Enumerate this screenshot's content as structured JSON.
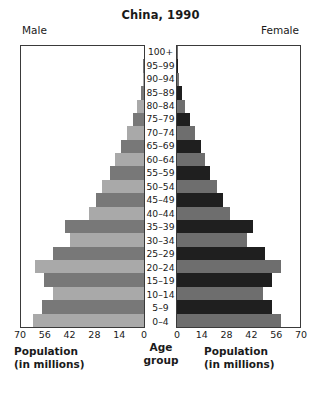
{
  "chart_data": {
    "type": "bar",
    "title": "China, 1990",
    "subtype": "population-pyramid",
    "xlabel": "Population (in millions)",
    "ylabel": "Age group",
    "left_header": "Male",
    "right_header": "Female",
    "xlim": [
      0,
      70
    ],
    "grid": false,
    "legend": "none",
    "ticks_left": [
      "70",
      "56",
      "42",
      "28",
      "14",
      "0"
    ],
    "ticks_right": [
      "0",
      "14",
      "28",
      "42",
      "56",
      "70"
    ],
    "tick_values": [
      0,
      14,
      28,
      42,
      56,
      70
    ],
    "categories": [
      "100+",
      "95–99",
      "90–94",
      "85–89",
      "80–84",
      "75–79",
      "70–74",
      "65–69",
      "60–64",
      "55–59",
      "50–54",
      "45–49",
      "40–44",
      "35–39",
      "30–34",
      "25–29",
      "20–24",
      "15–19",
      "10–14",
      "5–9",
      "0–4"
    ],
    "series": [
      {
        "name": "Male",
        "side": "left",
        "values": [
          0.1,
          0.3,
          0.8,
          2.0,
          4.0,
          6.5,
          9.5,
          13.0,
          16.5,
          19.5,
          24.0,
          27.5,
          31.5,
          45.0,
          42.0,
          52.0,
          62.0,
          57.0,
          52.0,
          58.0,
          63.0
        ]
      },
      {
        "name": "Female",
        "side": "right",
        "values": [
          0.2,
          0.5,
          1.2,
          2.6,
          4.8,
          7.2,
          10.0,
          13.5,
          16.0,
          18.5,
          22.5,
          26.0,
          30.0,
          43.0,
          40.0,
          50.0,
          59.0,
          54.0,
          49.0,
          54.0,
          59.0
        ]
      }
    ],
    "colors": {
      "male_light": "#a9a9a9",
      "male_dark": "#787878",
      "female_light": "#6e6e6e",
      "female_dark": "#1f1f1f",
      "axis": "#3a3a3a",
      "background": "#ffffff",
      "text": "#1a1a1a"
    }
  },
  "axis_titles": {
    "left_line1": "Population",
    "left_line2": "(in millions)",
    "right_line1": "Population",
    "right_line2": "(in millions)",
    "center_line1": "Age",
    "center_line2": "group"
  }
}
